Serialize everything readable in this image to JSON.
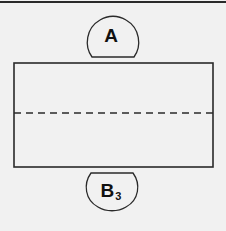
{
  "diagram": {
    "type": "net-template",
    "colors": {
      "background": "#f1f1f1",
      "stroke": "#2a2a2a",
      "text": "#111111"
    },
    "tab_top": {
      "label": "A",
      "position": "top"
    },
    "tab_bottom": {
      "label": "B",
      "subscript": "3",
      "position": "bottom"
    },
    "rectangle": {
      "fold_line": "dashed",
      "fold_position": "horizontal-middle"
    }
  }
}
